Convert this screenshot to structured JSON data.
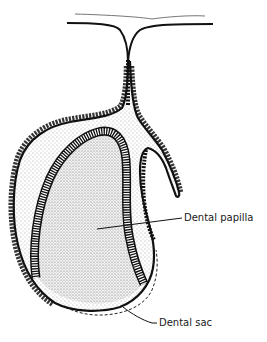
{
  "figure": {
    "labels": [
      {
        "id": "dental-papilla",
        "text": "Dental papilla"
      },
      {
        "id": "dental-sac",
        "text": "Dental sac"
      }
    ]
  }
}
